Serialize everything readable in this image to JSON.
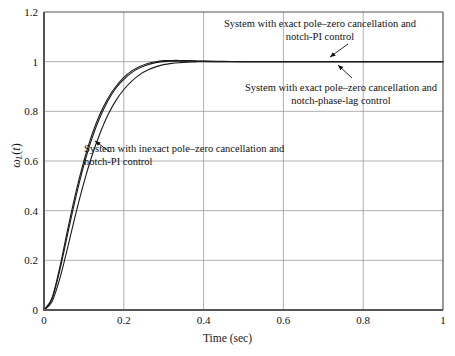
{
  "chart_data": {
    "type": "line",
    "title": "",
    "xlabel": "Time (sec)",
    "ylabel": "ω_L(t)",
    "xlim": [
      0,
      1
    ],
    "ylim": [
      0,
      1.2
    ],
    "xticks": [
      "0",
      "0.2",
      "0.4",
      "0.6",
      "0.8",
      "1"
    ],
    "xtick_values": [
      0,
      0.2,
      0.4,
      0.6,
      0.8,
      1
    ],
    "yticks": [
      "0",
      "0.2",
      "0.4",
      "0.6",
      "0.8",
      "1",
      "1.2"
    ],
    "ytick_values": [
      0,
      0.2,
      0.4,
      0.6,
      0.8,
      1,
      1.2
    ],
    "grid": true,
    "legend": "none",
    "line_color": "#1a1a1a",
    "grid_color": "#9a9a9a",
    "axis_color": "#555555",
    "x": [
      0,
      0.02,
      0.04,
      0.06,
      0.08,
      0.1,
      0.12,
      0.14,
      0.16,
      0.18,
      0.2,
      0.22,
      0.24,
      0.26,
      0.28,
      0.3,
      0.32,
      0.34,
      0.36,
      0.38,
      0.4,
      0.45,
      0.5,
      0.55,
      0.6,
      0.65,
      0.7,
      0.75,
      0.8,
      0.85,
      0.9,
      0.95,
      1.0
    ],
    "series": [
      {
        "name": "System with exact pole–zero cancellation and notch-PI control",
        "values": [
          0,
          0.048,
          0.175,
          0.33,
          0.475,
          0.6,
          0.705,
          0.788,
          0.852,
          0.9,
          0.937,
          0.963,
          0.981,
          0.993,
          1.0,
          1.004,
          1.005,
          1.005,
          1.004,
          1.003,
          1.002,
          1.001,
          1.0,
          1.0,
          1.0,
          1.0,
          1.0,
          1.0,
          1.0,
          1.0,
          1.0,
          1.0,
          1.0
        ]
      },
      {
        "name": "System with exact pole–zero cancellation and notch-phase-lag control",
        "values": [
          0,
          0.044,
          0.163,
          0.312,
          0.456,
          0.583,
          0.69,
          0.775,
          0.842,
          0.893,
          0.929,
          0.956,
          0.975,
          0.988,
          0.996,
          1.0,
          1.002,
          1.002,
          1.002,
          1.001,
          1.001,
          1.0,
          1.0,
          1.0,
          1.0,
          1.0,
          1.0,
          1.0,
          1.0,
          1.0,
          1.0,
          1.0,
          1.0
        ]
      },
      {
        "name": "System with inexact pole–zero cancellation and notch-PI control",
        "values": [
          0,
          0.033,
          0.128,
          0.256,
          0.39,
          0.513,
          0.62,
          0.71,
          0.785,
          0.843,
          0.888,
          0.922,
          0.948,
          0.966,
          0.979,
          0.988,
          0.993,
          0.996,
          0.998,
          0.999,
          1.0,
          1.0,
          1.0,
          1.0,
          1.0,
          1.0,
          1.0,
          1.0,
          1.0,
          1.0,
          1.0,
          1.0,
          1.0
        ]
      }
    ],
    "annotations": [
      {
        "id": "annot-0",
        "line1": "System with exact pole–zero cancellation and",
        "line2": "notch-PI control",
        "arrow_from": [
          348,
          44
        ],
        "arrow_to": [
          330,
          57
        ]
      },
      {
        "id": "annot-1",
        "line1": "System with exact pole–zero cancellation and",
        "line2": "notch-phase-lag control",
        "arrow_from": [
          352,
          78
        ],
        "arrow_to": [
          338,
          65
        ]
      },
      {
        "id": "annot-2",
        "line1": "System with inexact pole–zero cancellation and",
        "line2": "notch-PI control",
        "arrow_from": [
          110,
          152
        ],
        "arrow_to": [
          95,
          141
        ]
      }
    ]
  }
}
